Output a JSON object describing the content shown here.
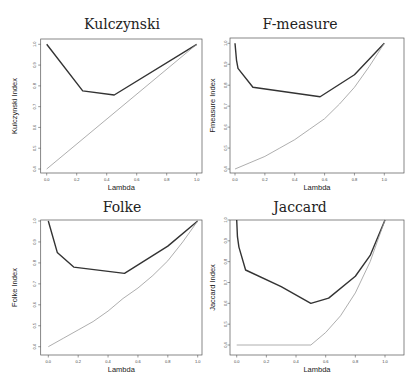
{
  "figure": {
    "panels": [
      {
        "id": "kulczynski",
        "title": "Kulczynski",
        "xlabel": "Lambda",
        "ylabel": "Kulczynski Index"
      },
      {
        "id": "fmeasure",
        "title": "F-measure",
        "xlabel": "Lambda",
        "ylabel": "Fmeasure Index"
      },
      {
        "id": "folke",
        "title": "Folke",
        "xlabel": "Lambda",
        "ylabel": "Folke Index"
      },
      {
        "id": "jaccard",
        "title": "Jaccard",
        "xlabel": "Lambda",
        "ylabel": "Jaccard Index"
      }
    ],
    "colors": {
      "upper_line": "#333333",
      "lower_line": "#999999",
      "frame": "#555555"
    }
  },
  "chart_data": [
    {
      "type": "line",
      "title": "Kulczynski",
      "xlabel": "Lambda",
      "ylabel": "Kulczynski Index",
      "xlim": [
        0,
        1
      ],
      "ylim": [
        0.4,
        1.0
      ],
      "xticks": [
        "0.0",
        "0.2",
        "0.4",
        "0.6",
        "0.8",
        "1.0"
      ],
      "yticks": [
        "0.4",
        "0.5",
        "0.6",
        "0.7",
        "0.8",
        "0.9",
        "1.0"
      ],
      "grid": false,
      "series": [
        {
          "name": "upper",
          "x": [
            0.0,
            0.24,
            0.45,
            1.0
          ],
          "y": [
            1.0,
            0.776,
            0.756,
            1.0
          ]
        },
        {
          "name": "lower",
          "x": [
            0.0,
            1.0
          ],
          "y": [
            0.4,
            1.0
          ]
        }
      ]
    },
    {
      "type": "line",
      "title": "F-measure",
      "xlabel": "Lambda",
      "ylabel": "Fmeasure Index",
      "xlim": [
        0,
        1
      ],
      "ylim": [
        0.4,
        1.0
      ],
      "xticks": [
        "0.0",
        "0.2",
        "0.4",
        "0.6",
        "0.8",
        "1.0"
      ],
      "yticks": [
        "0.4",
        "0.5",
        "0.6",
        "0.7",
        "0.8",
        "0.9",
        "1.0"
      ],
      "grid": false,
      "series": [
        {
          "name": "upper",
          "x": [
            0.0,
            0.01,
            0.02,
            0.12,
            0.57,
            0.8,
            1.0
          ],
          "y": [
            1.0,
            0.92,
            0.88,
            0.79,
            0.745,
            0.85,
            1.0
          ]
        },
        {
          "name": "lower",
          "x": [
            0.0,
            0.1,
            0.2,
            0.3,
            0.4,
            0.5,
            0.6,
            0.7,
            0.8,
            0.9,
            1.0
          ],
          "y": [
            0.4,
            0.43,
            0.46,
            0.5,
            0.54,
            0.59,
            0.64,
            0.71,
            0.79,
            0.89,
            1.0
          ]
        }
      ]
    },
    {
      "type": "line",
      "title": "Folke",
      "xlabel": "Lambda",
      "ylabel": "Folke Index",
      "xlim": [
        0,
        1
      ],
      "ylim": [
        0.4,
        1.0
      ],
      "xticks": [
        "0.0",
        "0.2",
        "0.4",
        "0.6",
        "0.8",
        "1.0"
      ],
      "yticks": [
        "0.4",
        "0.5",
        "0.6",
        "0.7",
        "0.8",
        "0.9",
        "1.0"
      ],
      "grid": false,
      "series": [
        {
          "name": "upper",
          "x": [
            0.0,
            0.06,
            0.17,
            0.51,
            0.8,
            1.0
          ],
          "y": [
            1.0,
            0.85,
            0.78,
            0.75,
            0.88,
            1.0
          ]
        },
        {
          "name": "lower",
          "x": [
            0.0,
            0.1,
            0.2,
            0.3,
            0.4,
            0.5,
            0.6,
            0.7,
            0.8,
            0.9,
            1.0
          ],
          "y": [
            0.4,
            0.44,
            0.48,
            0.52,
            0.57,
            0.63,
            0.68,
            0.74,
            0.81,
            0.9,
            1.0
          ]
        }
      ]
    },
    {
      "type": "line",
      "title": "Jaccard",
      "xlabel": "Lambda",
      "ylabel": "Jaccard Index",
      "xlim": [
        0,
        1
      ],
      "ylim": [
        0.4,
        1.0
      ],
      "xticks": [
        "0.0",
        "0.2",
        "0.4",
        "0.6",
        "0.8",
        "1.0"
      ],
      "yticks": [
        "0.4",
        "0.5",
        "0.6",
        "0.7",
        "0.8",
        "0.9",
        "1.0"
      ],
      "grid": false,
      "series": [
        {
          "name": "upper",
          "x": [
            0.0,
            0.005,
            0.015,
            0.06,
            0.3,
            0.5,
            0.62,
            0.8,
            0.9,
            1.0
          ],
          "y": [
            1.0,
            0.92,
            0.87,
            0.76,
            0.68,
            0.6,
            0.625,
            0.73,
            0.83,
            1.0
          ]
        },
        {
          "name": "lower",
          "x": [
            0.0,
            0.5,
            0.6,
            0.7,
            0.8,
            0.9,
            1.0
          ],
          "y": [
            0.4,
            0.4,
            0.46,
            0.54,
            0.65,
            0.8,
            1.0
          ]
        }
      ]
    }
  ]
}
